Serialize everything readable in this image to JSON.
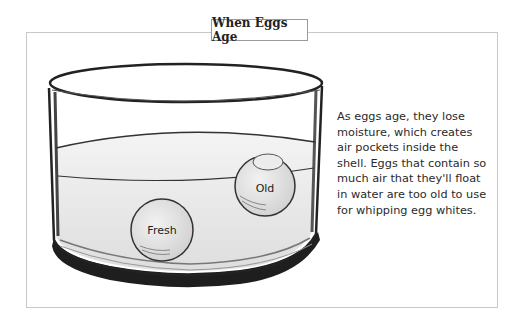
{
  "title": "When Eggs Age",
  "illustration": {
    "subject": "glass bowl of water with two eggs",
    "eggs": [
      {
        "label": "Fresh",
        "position": "sunk at bottom"
      },
      {
        "label": "Old",
        "position": "floating at surface"
      }
    ]
  },
  "caption": {
    "lines": [
      "As eggs age, they lose",
      "moisture, which creates",
      "air pockets inside the",
      "shell. Eggs that contain so",
      "much air that they'll float",
      "in water are too old to use",
      "for whipping egg whites."
    ]
  },
  "colors": {
    "frame": "#c8c8c8",
    "ink": "#222222",
    "bowl_base": "#1e1e1e"
  }
}
